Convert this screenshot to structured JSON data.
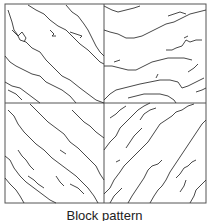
{
  "figure": {
    "caption": "Block pattern",
    "quadrants": [
      {
        "position": "top-left",
        "crack_direction": "diagonal-down-right"
      },
      {
        "position": "top-right",
        "crack_direction": "horizontal"
      },
      {
        "position": "bottom-left",
        "crack_direction": "diagonal-down-right"
      },
      {
        "position": "bottom-right",
        "crack_direction": "diagonal-up-right"
      }
    ],
    "colors": {
      "line": "#333333",
      "border": "#555555",
      "background": "#ffffff"
    }
  }
}
